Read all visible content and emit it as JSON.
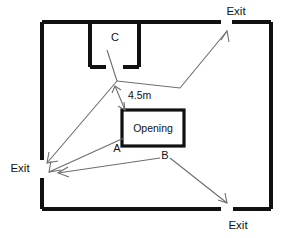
{
  "diagram": {
    "type": "floor-plan",
    "canvas": {
      "width": 295,
      "height": 238
    },
    "colors": {
      "wall": "#111111",
      "path": "#6d6d6d",
      "background": "#ffffff",
      "text": "#111111"
    },
    "room": {
      "name": "main-room",
      "x": 42,
      "y": 22,
      "width": 229,
      "height": 187
    },
    "labels": {
      "exit_top_right": "Exit",
      "exit_left": "Exit",
      "exit_bottom_right": "Exit",
      "zone_c": "C",
      "zone_a": "A",
      "zone_b": "B",
      "opening": "Opening",
      "dimension": "4.5m"
    },
    "exits": [
      {
        "name": "exit-top-right",
        "label": "Exit",
        "wall": "top",
        "x": 226,
        "y": 22,
        "label_x": 236,
        "label_y": 12
      },
      {
        "name": "exit-left",
        "label": "Exit",
        "wall": "left",
        "x": 42,
        "y": 168,
        "label_x": 20,
        "label_y": 169
      },
      {
        "name": "exit-bottom-right",
        "label": "Exit",
        "wall": "bottom",
        "x": 227,
        "y": 209,
        "label_x": 237,
        "label_y": 226
      }
    ],
    "rooms": [
      {
        "name": "alcove-c",
        "label": "C",
        "x": 90,
        "y": 22,
        "width": 49,
        "height": 45,
        "label_x": 115,
        "label_y": 37,
        "door_gap": {
          "x1": 105,
          "x2": 123,
          "y": 67
        }
      }
    ],
    "boxes": [
      {
        "name": "opening-box",
        "label": "Opening",
        "x": 122,
        "y": 110,
        "width": 62,
        "height": 36,
        "label_x": 153,
        "label_y": 128
      }
    ],
    "zone_markers": [
      {
        "name": "zone-label-a",
        "label": "A",
        "x": 117,
        "y": 148
      },
      {
        "name": "zone-label-b",
        "label": "B",
        "x": 164,
        "y": 156
      },
      {
        "name": "zone-label-c",
        "label": "C",
        "x": 115,
        "y": 37
      }
    ],
    "dimension": {
      "name": "dimension-4-5m",
      "label": "4.5m",
      "label_x": 131,
      "label_y": 97,
      "from": {
        "x": 115,
        "y": 88
      },
      "to": {
        "x": 124,
        "y": 110
      }
    },
    "paths": [
      {
        "name": "path-c-to-exit-top-right",
        "points": "107,50 117,81 180,88 225,33",
        "arrow_at": {
          "x": 225,
          "y": 33,
          "angle": -50
        }
      },
      {
        "name": "path-c-to-exit-left",
        "points": "117,81 48,163",
        "arrow_at": {
          "x": 48,
          "y": 163,
          "angle": 130
        }
      },
      {
        "name": "path-a-to-exit-left",
        "points": "124,138 49,172",
        "arrow_at": {
          "x": 49,
          "y": 172,
          "angle": 155
        }
      },
      {
        "name": "path-b-to-exit-left",
        "points": "160,158 58,173",
        "arrow_at": {
          "x": 58,
          "y": 173,
          "angle": 172
        }
      },
      {
        "name": "path-b-to-exit-bottom-right",
        "points": "170,158 226,203",
        "arrow_at": {
          "x": 226,
          "y": 203,
          "angle": 39
        }
      }
    ]
  }
}
